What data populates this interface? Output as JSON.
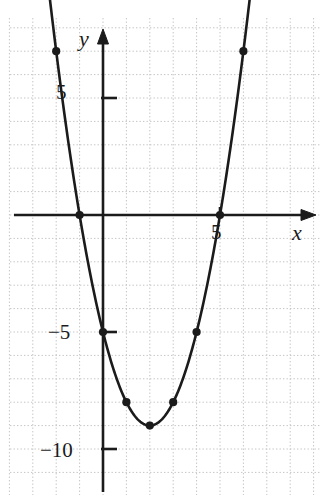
{
  "figure": {
    "type": "graph",
    "background_color": "#ffffff",
    "curve_color": "#1b1b1b",
    "grid_color": "#c9c9c9",
    "axis_color": "#1b1b1b"
  },
  "axes": {
    "x_axis_label": "x",
    "y_axis_label": "y",
    "x_tick_labels": [
      "5"
    ],
    "y_tick_labels": [
      "5",
      "−5",
      "−10"
    ]
  },
  "chart_data": {
    "type": "line",
    "title": "",
    "xlabel": "x",
    "ylabel": "y",
    "grid": true,
    "legend": "none",
    "equation": "y = x² − 4x − 5",
    "xlim": [
      -4,
      9
    ],
    "ylim": [
      -13,
      9
    ],
    "x_ticks": [
      5
    ],
    "y_ticks": [
      5,
      -5,
      -10
    ],
    "x_tick_labels": [
      "5"
    ],
    "y_tick_labels": [
      "5",
      "−5",
      "−10"
    ],
    "x": [
      -2,
      -1,
      0,
      1,
      2,
      3,
      4,
      5,
      6
    ],
    "values": [
      7,
      0,
      -5,
      -8,
      -9,
      -8,
      -5,
      0,
      7
    ],
    "marked_points": [
      {
        "x": -2,
        "y": 7
      },
      {
        "x": -1,
        "y": 0
      },
      {
        "x": 0,
        "y": -5
      },
      {
        "x": 1,
        "y": -8
      },
      {
        "x": 2,
        "y": -9
      },
      {
        "x": 3,
        "y": -8
      },
      {
        "x": 4,
        "y": -5
      },
      {
        "x": 5,
        "y": 0
      },
      {
        "x": 6,
        "y": 7
      }
    ],
    "roots": [
      -1,
      5
    ],
    "vertex": {
      "x": 2,
      "y": -9
    },
    "y_intercept": -5,
    "grid_spacing": 1
  }
}
